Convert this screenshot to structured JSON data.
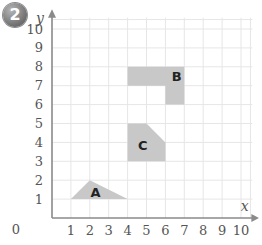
{
  "question_number": "2",
  "chart_data": {
    "type": "diagram",
    "title": "",
    "xlabel": "x",
    "ylabel": "y",
    "xlim": [
      0,
      10
    ],
    "ylim": [
      0,
      10
    ],
    "origin_label": "0",
    "x_ticks": [
      "1",
      "2",
      "3",
      "4",
      "5",
      "6",
      "7",
      "8",
      "9",
      "10"
    ],
    "y_ticks": [
      "1",
      "2",
      "3",
      "4",
      "5",
      "6",
      "7",
      "8",
      "9",
      "10"
    ],
    "grid": true,
    "shapes": [
      {
        "label": "A",
        "type": "triangle",
        "points": [
          [
            1,
            1
          ],
          [
            2,
            2
          ],
          [
            4,
            1
          ]
        ],
        "label_pos": [
          2.3,
          1.35
        ]
      },
      {
        "label": "B",
        "type": "polygon",
        "points": [
          [
            4,
            7
          ],
          [
            4,
            8
          ],
          [
            7,
            8
          ],
          [
            7,
            6
          ],
          [
            6,
            6
          ],
          [
            6,
            7
          ]
        ],
        "label_pos": [
          6.6,
          7.5
        ]
      },
      {
        "label": "C",
        "type": "polygon",
        "points": [
          [
            4,
            3
          ],
          [
            4,
            5
          ],
          [
            5,
            5
          ],
          [
            6,
            4
          ],
          [
            6,
            3
          ]
        ],
        "label_pos": [
          4.8,
          3.85
        ]
      }
    ],
    "colors": {
      "shape_fill": "#c8c8c8",
      "grid": "#e6e6e6",
      "axis": "#8a8a8a"
    }
  }
}
